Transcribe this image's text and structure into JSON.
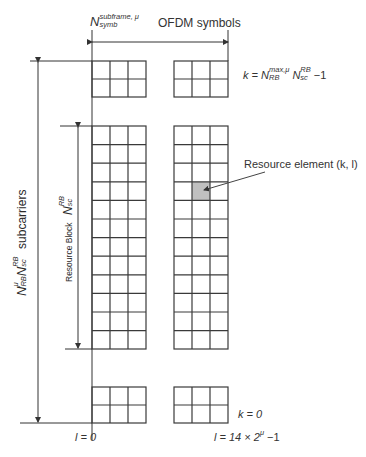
{
  "diagram": {
    "title_top": {
      "n_symbol": "N",
      "n_superscript": "subframe, μ",
      "n_subscript": "symb",
      "ofdm_label": "OFDM symbols"
    },
    "k_max_label": {
      "prefix": "k = N",
      "sup1": "max,μ",
      "sub1": "RB",
      "mid": " N",
      "sup2": "RB",
      "sub2": "sc",
      "suffix": " −1"
    },
    "resource_element_label": "Resource element (k, l)",
    "resource_block_label": {
      "text": "Resource Block",
      "n_symbol": "N",
      "superscript": "RB",
      "subscript": "sc"
    },
    "subcarriers_label": {
      "n1": "N",
      "n1_sup": "μ",
      "n1_sub": "RB",
      "n2": "N",
      "n2_sup": "RB",
      "n2_sub": "sc",
      "text": "subcarriers"
    },
    "k_zero_label": "k = 0",
    "l_zero_label": "l = 0",
    "l_max_label": "l = 14 × 2",
    "l_max_sup": "μ",
    "l_max_suffix": " −1",
    "colors": {
      "grid_line": "#3a3a3a",
      "highlight_cell": "#c0c0c0",
      "text": "#333333"
    },
    "grid": {
      "columns_per_group": 3,
      "top_block_rows": 2,
      "resource_block_rows": 12,
      "bottom_block_rows": 2,
      "highlight": {
        "group": "right",
        "column": 2,
        "row": 4
      }
    }
  }
}
